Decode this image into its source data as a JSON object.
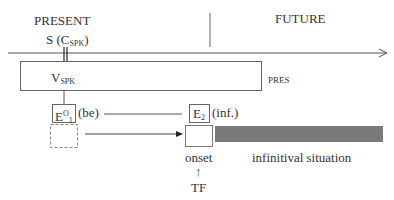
{
  "labels": {
    "present": "PRESENT",
    "future": "FUTURE",
    "speaker_S": "S",
    "speaker_C": "(C",
    "speaker_sub": "SPK",
    "speaker_close": ")",
    "v": "V",
    "v_sub": "SPK",
    "pres": "PRES",
    "e1": "E",
    "e1_sup": "O",
    "e1_sub": "1",
    "e1_note": "(be)",
    "e2": "E",
    "e2_sub": "2",
    "e2_note": "(inf.)",
    "onset": "onset",
    "tf_arrow": "↑",
    "tf": "TF",
    "infinitival": "infinitival situation"
  },
  "colors": {
    "line": "#555555",
    "bar": "#7a7a7a",
    "dashed": "#888888"
  }
}
